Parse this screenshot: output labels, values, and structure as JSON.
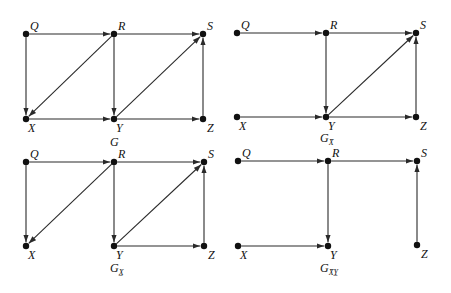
{
  "diagram": {
    "type": "causal-dag-panels",
    "panels": [
      {
        "id": "G",
        "title": "G",
        "title_sub": "",
        "nodes": {
          "Q": [
            26,
            34
          ],
          "R": [
            114,
            34
          ],
          "S": [
            203,
            34
          ],
          "X": [
            26,
            119
          ],
          "Y": [
            114,
            119
          ],
          "Z": [
            203,
            119
          ]
        },
        "edges": [
          [
            "Q",
            "R"
          ],
          [
            "R",
            "S"
          ],
          [
            "Q",
            "X"
          ],
          [
            "R",
            "X"
          ],
          [
            "R",
            "Y"
          ],
          [
            "X",
            "Y"
          ],
          [
            "Y",
            "S"
          ],
          [
            "Y",
            "Z"
          ],
          [
            "Z",
            "S"
          ]
        ],
        "title_pos": [
          110,
          146
        ]
      },
      {
        "id": "G_Xbar",
        "title": "G",
        "title_sub": "X̄",
        "nodes": {
          "Q": [
            237,
            33
          ],
          "R": [
            326,
            33
          ],
          "S": [
            416,
            33
          ],
          "X": [
            237,
            117
          ],
          "Y": [
            326,
            117
          ],
          "Z": [
            416,
            117
          ]
        },
        "edges": [
          [
            "Q",
            "R"
          ],
          [
            "R",
            "S"
          ],
          [
            "R",
            "Y"
          ],
          [
            "X",
            "Y"
          ],
          [
            "Y",
            "S"
          ],
          [
            "Y",
            "Z"
          ],
          [
            "Z",
            "S"
          ]
        ],
        "title_pos": [
          320,
          142
        ]
      },
      {
        "id": "G_Xunderline",
        "title": "G",
        "title_sub": "X̲",
        "nodes": {
          "Q": [
            26,
            162
          ],
          "R": [
            114,
            162
          ],
          "S": [
            204,
            162
          ],
          "X": [
            26,
            246
          ],
          "Y": [
            114,
            246
          ],
          "Z": [
            204,
            246
          ]
        },
        "edges": [
          [
            "Q",
            "R"
          ],
          [
            "R",
            "S"
          ],
          [
            "Q",
            "X"
          ],
          [
            "R",
            "X"
          ],
          [
            "R",
            "Y"
          ],
          [
            "Y",
            "S"
          ],
          [
            "Y",
            "Z"
          ],
          [
            "Z",
            "S"
          ]
        ],
        "title_pos": [
          110,
          272
        ]
      },
      {
        "id": "G_XbarYunderline",
        "title": "G",
        "title_sub": "X̄Y̲",
        "nodes": {
          "Q": [
            238,
            161
          ],
          "R": [
            328,
            161
          ],
          "S": [
            417,
            161
          ],
          "X": [
            238,
            246
          ],
          "Y": [
            328,
            246
          ],
          "Z": [
            417,
            245
          ]
        },
        "edges": [
          [
            "Q",
            "R"
          ],
          [
            "R",
            "S"
          ],
          [
            "R",
            "Y"
          ],
          [
            "X",
            "Y"
          ],
          [
            "Z",
            "S"
          ]
        ],
        "title_pos": [
          320,
          272
        ]
      }
    ]
  },
  "labels": {
    "Q": "Q",
    "R": "R",
    "S": "S",
    "X": "X",
    "Y": "Y",
    "Z": "Z"
  }
}
